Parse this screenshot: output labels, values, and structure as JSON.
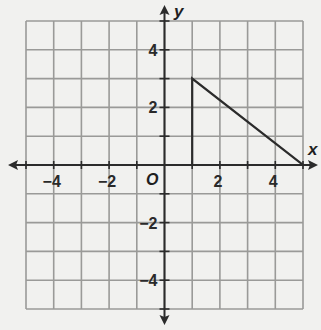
{
  "chart_data": {
    "type": "line",
    "title": "",
    "xlabel": "x",
    "ylabel": "y",
    "xlim": [
      -5,
      5
    ],
    "ylim": [
      -5,
      5
    ],
    "grid": true,
    "grid_step": 1,
    "x_tick_labels": [
      {
        "value": -4,
        "text": "−4"
      },
      {
        "value": -2,
        "text": "−2"
      },
      {
        "value": 2,
        "text": "2"
      },
      {
        "value": 4,
        "text": "4"
      }
    ],
    "y_tick_labels": [
      {
        "value": 4,
        "text": "4"
      },
      {
        "value": 2,
        "text": "2"
      },
      {
        "value": -2,
        "text": "−2"
      },
      {
        "value": -4,
        "text": "−4"
      }
    ],
    "origin_label": "O",
    "series": [
      {
        "name": "triangle",
        "shape": "polygon",
        "points": [
          [
            1,
            3
          ],
          [
            1,
            0
          ],
          [
            5,
            0
          ]
        ]
      }
    ]
  },
  "colors": {
    "background": "#f1f1ef",
    "grid": "#9a9a98",
    "axis": "#2b2b2b",
    "shape": "#2b2b2b"
  }
}
